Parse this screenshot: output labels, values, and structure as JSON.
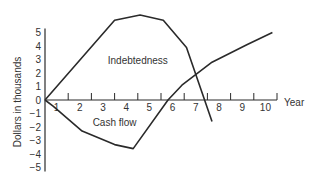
{
  "chart_data": {
    "type": "line",
    "title": "",
    "xlabel": "Year",
    "ylabel": "Dollars in thousands",
    "xlim": [
      0,
      10
    ],
    "ylim": [
      -5,
      5
    ],
    "x_ticks": [
      1,
      2,
      3,
      4,
      5,
      6,
      7,
      8,
      9,
      10
    ],
    "y_ticks": [
      5,
      4,
      3,
      2,
      1,
      0,
      -1,
      -2,
      -3,
      -4,
      -5
    ],
    "grid": false,
    "legend": "none (inline series labels)",
    "series": [
      {
        "name": "Indebtedness",
        "label_position": {
          "x": 4.0,
          "y": 2.7
        },
        "points": [
          [
            0,
            0
          ],
          [
            3.0,
            5.9
          ],
          [
            4.1,
            6.3
          ],
          [
            5.1,
            5.9
          ],
          [
            6.1,
            3.9
          ],
          [
            7.2,
            -1.6
          ]
        ]
      },
      {
        "name": "Cash flow",
        "label_position": {
          "x": 3.0,
          "y": -1.9
        },
        "points": [
          [
            0,
            0
          ],
          [
            0.35,
            -0.45
          ],
          [
            1.6,
            -2.3
          ],
          [
            3.0,
            -3.3
          ],
          [
            3.8,
            -3.6
          ],
          [
            5.3,
            0
          ],
          [
            5.9,
            1.1
          ],
          [
            7.2,
            2.8
          ],
          [
            8.7,
            4.1
          ],
          [
            9.8,
            5.0
          ]
        ]
      }
    ]
  }
}
